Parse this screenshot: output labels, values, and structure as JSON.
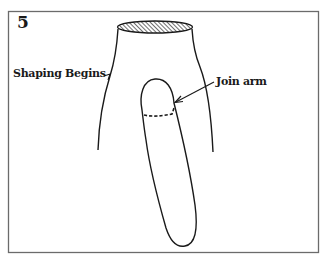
{
  "figure": {
    "step_number": "5",
    "labels": {
      "shaping_begins": "Shaping Begins",
      "join_arm": "Join arm"
    },
    "colors": {
      "line": "#1a1a1a",
      "frame": "#6b6b6b",
      "background": "#ffffff"
    },
    "parts": [
      "frame",
      "neck-opening-hatched-ellipse",
      "body-outline-left",
      "body-outline-right",
      "sleeve-outline",
      "sleeve-join-dashed-line",
      "join-arm-arrow",
      "shaping-begins-leader"
    ]
  }
}
